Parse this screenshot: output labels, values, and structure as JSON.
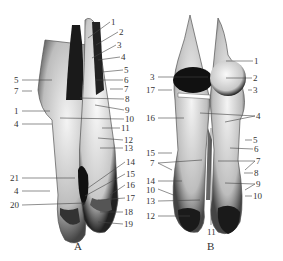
{
  "figure": {
    "panels": [
      {
        "id": "A",
        "caption": "A",
        "labels_left": [
          "5",
          "7",
          "1",
          "4",
          "21",
          "4",
          "20"
        ],
        "labels_right": [
          "1",
          "2",
          "3",
          "4",
          "5",
          "6",
          "7",
          "8",
          "9",
          "10",
          "11",
          "12",
          "13",
          "14",
          "15",
          "16",
          "17",
          "18",
          "19"
        ]
      },
      {
        "id": "B",
        "caption": "B",
        "labels_left": [
          "3",
          "17",
          "16",
          "15",
          "7",
          "14",
          "10",
          "13",
          "12"
        ],
        "labels_right": [
          "1",
          "2",
          "3",
          "4",
          "5",
          "6",
          "7",
          "8",
          "9",
          "10"
        ],
        "labels_bottom": [
          "11"
        ]
      }
    ]
  }
}
